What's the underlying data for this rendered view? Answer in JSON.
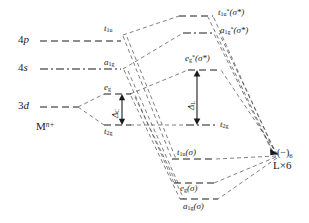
{
  "diagram": {
    "metal": {
      "fragment_label": "M",
      "fragment_charge": "n+",
      "levels": [
        {
          "id": "4p",
          "symbol": "4",
          "orbital": "p",
          "y": 41
        },
        {
          "id": "4s",
          "symbol": "4",
          "orbital": "s",
          "y": 69
        },
        {
          "id": "3d",
          "symbol": "3",
          "orbital": "d",
          "y": 107
        }
      ]
    },
    "crystal_field": {
      "levels": [
        {
          "id": "t1u",
          "base": "t",
          "sub": "1u",
          "y": 35
        },
        {
          "id": "a1g",
          "base": "a",
          "sub": "1g",
          "y": 69
        },
        {
          "id": "eg",
          "base": "e",
          "sub": "g",
          "y": 94
        },
        {
          "id": "t2g",
          "base": "t",
          "sub": "2g",
          "y": 125
        }
      ],
      "splitting": {
        "symbol": "Δ",
        "sub": "C"
      }
    },
    "molecular_orbitals": {
      "antibonding": [
        {
          "id": "t1u-star",
          "base": "t",
          "sub": "1u",
          "star": "*",
          "paren": "(σ*)",
          "y": 16
        },
        {
          "id": "a1g-star",
          "base": "a",
          "sub": "1g",
          "star": "*",
          "paren": "(σ*)",
          "y": 33
        },
        {
          "id": "eg-star",
          "base": "e",
          "sub": "g",
          "star": "*",
          "paren": "(σ*)",
          "y": 70
        }
      ],
      "nonbonding": [
        {
          "id": "t2g-mo",
          "base": "t",
          "sub": "2g",
          "y": 125
        }
      ],
      "bonding": [
        {
          "id": "t1u-sigma",
          "base": "t",
          "sub": "1u",
          "paren": "(σ)",
          "y": 159
        },
        {
          "id": "eg-sigma",
          "base": "e",
          "sub": "g",
          "paren": "(σ)",
          "y": 183
        },
        {
          "id": "a1g-sigma",
          "base": "a",
          "sub": "1g",
          "paren": "(σ)",
          "y": 199
        }
      ],
      "splitting": {
        "symbol": "Δ",
        "sub": "L"
      }
    },
    "ligand": {
      "charge_label": "(−)",
      "charge_sub": "6",
      "count_label": "L×6",
      "y": 155
    },
    "colors": {
      "line": "#1a1a1a",
      "correlation": "#4a4a4a",
      "background": "#ffffff"
    }
  }
}
